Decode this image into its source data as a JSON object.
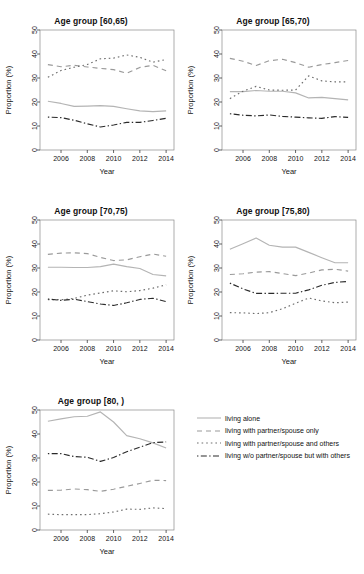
{
  "figure": {
    "width": 364,
    "height": 574,
    "background": "#ffffff",
    "xlabel": "Year",
    "ylabel": "Proportion (%)",
    "xlim": [
      2004.4,
      2014.6
    ],
    "ylim": [
      0,
      50
    ],
    "xticks": [
      2006,
      2008,
      2010,
      2012,
      2014
    ],
    "yticks": [
      0,
      10,
      20,
      30,
      40,
      50
    ],
    "years": [
      2005,
      2006,
      2007,
      2008,
      2009,
      2010,
      2011,
      2012,
      2013,
      2014
    ]
  },
  "series_style": {
    "living_alone": {
      "color": "#b4b4b4",
      "dash": "none",
      "label": "living alone"
    },
    "partner_only": {
      "color": "#9a9a9a",
      "dash": "dashed",
      "label": "living with partner/spouse only"
    },
    "partner_others": {
      "color": "#6e6e6e",
      "dash": "dotted",
      "label": "living with partner/spouse and others"
    },
    "no_partner_others": {
      "color": "#2a2a2a",
      "dash": "dashdot",
      "label": "living w/o partner/spouse but with others"
    }
  },
  "legend": {
    "items": [
      {
        "key": "living_alone",
        "label": "living alone"
      },
      {
        "key": "partner_only",
        "label": "living with partner/spouse only"
      },
      {
        "key": "partner_others",
        "label": "living with partner/spouse and others"
      },
      {
        "key": "no_partner_others",
        "label": "living w/o partner/spouse but with others"
      }
    ]
  },
  "chart_data": {
    "type": "line",
    "xlabel": "Year",
    "ylabel": "Proportion (%)",
    "xlim": [
      2004.4,
      2014.6
    ],
    "ylim": [
      0,
      50
    ],
    "xticks": [
      2006,
      2008,
      2010,
      2012,
      2014
    ],
    "yticks": [
      0,
      10,
      20,
      30,
      40,
      50
    ],
    "grid": false,
    "legend_position": "bottom-right",
    "x": [
      2005,
      2006,
      2007,
      2008,
      2009,
      2010,
      2011,
      2012,
      2013,
      2014
    ],
    "panels": [
      {
        "title": "Age group [60,65)",
        "series": [
          {
            "name": "living alone",
            "key": "living_alone",
            "values": [
              20.3,
              19.4,
              18.2,
              18.3,
              18.5,
              18.2,
              17.2,
              16.3,
              16.0,
              16.3
            ]
          },
          {
            "name": "living with partner/spouse only",
            "key": "partner_only",
            "values": [
              35.6,
              34.7,
              35.3,
              34.6,
              34.0,
              33.5,
              32.0,
              34.4,
              35.3,
              33.0
            ]
          },
          {
            "name": "living with partner/spouse and others",
            "key": "partner_others",
            "values": [
              30.3,
              33.1,
              34.5,
              35.6,
              38.0,
              38.3,
              39.6,
              38.6,
              36.6,
              37.7
            ]
          },
          {
            "name": "living w/o partner/spouse but with others",
            "key": "no_partner_others",
            "values": [
              13.7,
              13.5,
              12.4,
              10.9,
              9.6,
              10.4,
              11.5,
              11.5,
              12.3,
              13.2
            ]
          }
        ]
      },
      {
        "title": "Age group [65,70)",
        "series": [
          {
            "name": "living alone",
            "key": "living_alone",
            "values": [
              24.3,
              24.3,
              24.8,
              24.5,
              24.5,
              23.8,
              21.7,
              21.9,
              21.4,
              20.9
            ]
          },
          {
            "name": "living with partner/spouse only",
            "key": "partner_only",
            "values": [
              38.2,
              37.0,
              35.2,
              37.2,
              37.8,
              36.4,
              34.5,
              35.6,
              36.4,
              37.3
            ]
          },
          {
            "name": "living with partner/spouse and others",
            "key": "partner_others",
            "values": [
              21.4,
              24.5,
              26.5,
              25.0,
              24.9,
              25.0,
              30.9,
              28.8,
              28.4,
              28.4
            ]
          },
          {
            "name": "living w/o partner/spouse but with others",
            "key": "no_partner_others",
            "values": [
              15.1,
              14.5,
              14.2,
              14.6,
              14.0,
              13.7,
              13.4,
              13.2,
              13.9,
              13.6
            ]
          }
        ]
      },
      {
        "title": "Age group [70,75)",
        "series": [
          {
            "name": "living alone",
            "key": "living_alone",
            "values": [
              30.3,
              30.3,
              30.2,
              30.2,
              30.6,
              31.6,
              30.6,
              29.8,
              27.3,
              26.7
            ]
          },
          {
            "name": "living with partner/spouse only",
            "key": "partner_only",
            "values": [
              35.7,
              36.2,
              36.3,
              36.0,
              34.4,
              33.1,
              33.4,
              34.7,
              35.8,
              34.9
            ]
          },
          {
            "name": "living with partner/spouse and others",
            "key": "partner_others",
            "values": [
              16.8,
              16.8,
              17.3,
              18.7,
              19.6,
              20.5,
              20.1,
              20.6,
              21.6,
              23.0
            ]
          },
          {
            "name": "living w/o partner/spouse but with others",
            "key": "no_partner_others",
            "values": [
              17.1,
              16.5,
              17.0,
              16.0,
              15.0,
              14.4,
              15.5,
              16.9,
              17.4,
              16.0
            ]
          }
        ]
      },
      {
        "title": "Age group [75,80)",
        "series": [
          {
            "name": "living alone",
            "key": "living_alone",
            "values": [
              37.8,
              40.1,
              42.5,
              39.5,
              38.7,
              38.7,
              36.5,
              34.3,
              32.2,
              32.2
            ]
          },
          {
            "name": "living with partner/spouse only",
            "key": "partner_only",
            "values": [
              27.3,
              27.6,
              28.3,
              28.5,
              27.7,
              26.8,
              27.9,
              29.2,
              29.5,
              28.7
            ]
          },
          {
            "name": "living with partner/spouse and others",
            "key": "partner_others",
            "values": [
              11.4,
              11.3,
              11.0,
              11.4,
              13.0,
              15.3,
              17.5,
              16.3,
              15.5,
              15.8
            ]
          },
          {
            "name": "living w/o partner/spouse but with others",
            "key": "no_partner_others",
            "values": [
              23.7,
              21.3,
              19.4,
              19.4,
              19.5,
              19.5,
              20.9,
              22.8,
              24.0,
              24.4
            ]
          }
        ]
      },
      {
        "title": "Age group [80, )",
        "series": [
          {
            "name": "living alone",
            "key": "living_alone",
            "values": [
              45.3,
              46.3,
              47.2,
              47.4,
              49.2,
              45.0,
              39.3,
              38.0,
              36.3,
              34.2
            ]
          },
          {
            "name": "living with partner/spouse only",
            "key": "partner_only",
            "values": [
              16.5,
              16.6,
              17.1,
              16.8,
              16.1,
              17.0,
              18.2,
              19.4,
              20.7,
              20.6
            ]
          },
          {
            "name": "living with partner/spouse and others",
            "key": "partner_others",
            "values": [
              6.6,
              6.4,
              6.4,
              6.4,
              6.8,
              7.5,
              8.7,
              8.6,
              9.2,
              8.9
            ]
          },
          {
            "name": "living w/o partner/spouse but with others",
            "key": "no_partner_others",
            "values": [
              31.8,
              31.8,
              30.6,
              30.3,
              28.6,
              30.2,
              32.6,
              34.5,
              36.4,
              36.7
            ]
          }
        ]
      }
    ]
  }
}
